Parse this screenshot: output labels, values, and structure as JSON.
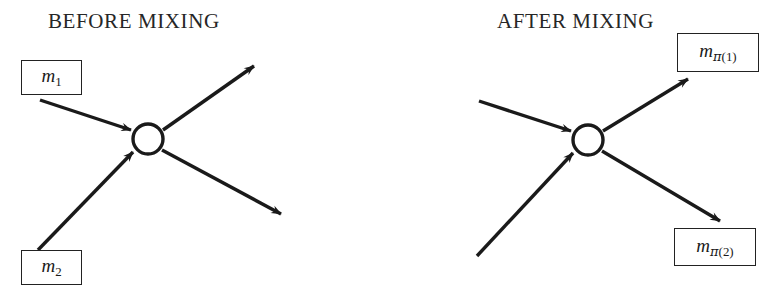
{
  "figure": {
    "width": 775,
    "height": 282,
    "background_color": "#ffffff",
    "stroke_color": "#1a1a1a",
    "node_fill_color": "#ffffff"
  },
  "panels": [
    {
      "id": "before",
      "title": "BEFORE MIXING",
      "node": {
        "cx": 148,
        "cy": 139,
        "r": 15
      },
      "incoming": [
        {
          "name": "m_1",
          "from_x": 40,
          "from_y": 100,
          "to_x": 131,
          "to_y": 130
        },
        {
          "name": "m_2",
          "from_x": 38,
          "from_y": 250,
          "to_x": 133,
          "to_y": 152
        }
      ],
      "outgoing": [
        {
          "name": "out_upper",
          "from_x": 163,
          "from_y": 130,
          "to_x": 256,
          "to_y": 64
        },
        {
          "name": "out_lower",
          "from_x": 162,
          "from_y": 150,
          "to_x": 283,
          "to_y": 216
        }
      ],
      "labels": [
        {
          "id": "m1",
          "base": "m",
          "subscript": "1"
        },
        {
          "id": "m2",
          "base": "m",
          "subscript": "2"
        }
      ]
    },
    {
      "id": "after",
      "title": "AFTER MIXING",
      "node": {
        "cx": 588,
        "cy": 140,
        "r": 15
      },
      "incoming": [
        {
          "name": "in_upper",
          "from_x": 479,
          "from_y": 101,
          "to_x": 571,
          "to_y": 131
        },
        {
          "name": "in_lower",
          "from_x": 477,
          "from_y": 256,
          "to_x": 573,
          "to_y": 153
        }
      ],
      "outgoing": [
        {
          "name": "out_mpi1",
          "from_x": 603,
          "from_y": 131,
          "to_x": 690,
          "to_y": 77
        },
        {
          "name": "out_mpi2",
          "from_x": 602,
          "from_y": 151,
          "to_x": 722,
          "to_y": 223
        }
      ],
      "labels": [
        {
          "id": "mpi1",
          "base": "m",
          "subscript_pi": "π",
          "subscript_index": "(1)"
        },
        {
          "id": "mpi2",
          "base": "m",
          "subscript_pi": "π",
          "subscript_index": "(2)"
        }
      ]
    }
  ],
  "labels": {
    "m1": {
      "base": "m",
      "sub": "1"
    },
    "m2": {
      "base": "m",
      "sub": "2"
    },
    "mpi1": {
      "base": "m",
      "sub_pi": "π",
      "sub_index": "(1)"
    },
    "mpi2": {
      "base": "m",
      "sub_pi": "π",
      "sub_index": "(2)"
    }
  },
  "titles": {
    "before": "BEFORE MIXING",
    "after": "AFTER MIXING"
  }
}
